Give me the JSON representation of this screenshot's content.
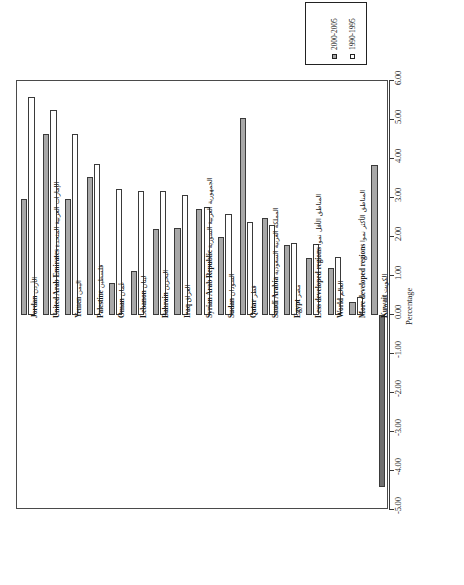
{
  "chart_data": {
    "type": "bar",
    "title": "",
    "xlabel": "",
    "ylabel": "Percentage",
    "ylim": [
      -5.0,
      6.0
    ],
    "tick_step": 1.0,
    "orientation": "rotated-vertical-bars",
    "grid": false,
    "legend_position": "top-right",
    "tick_labels": [
      "-5.00",
      "-4.00",
      "-3.00",
      "-2.00",
      "-1.00",
      "0.00",
      "1.00",
      "2.00",
      "3.00",
      "4.00",
      "5.00",
      "6.00"
    ],
    "tick_values": [
      -5,
      -4,
      -3,
      -2,
      -1,
      0,
      1,
      2,
      3,
      4,
      5,
      6
    ],
    "categories": [
      "الأردن Jordan",
      "الإمارات العربية المتحدة United Arab Emirates",
      "اليمن Yemen",
      "فلسطين Palestine",
      "عُمان Oman",
      "لبنان Lebanon",
      "البحرين Bahrain",
      "العراق Iraq",
      "الجمهورية العربية السورية Syrian Arab Republic",
      "السودان Sudan",
      "قطر Qatar",
      "المملكة العربية السعودية Saudi Arabia",
      "مصر Egypt",
      "الأقل نموا المناطق Less developed regions",
      "العالم World",
      "الأكثر نموا المناطق More developed regions",
      "الكويت Kuwait"
    ],
    "categories_ar": [
      "الأردن",
      "الإمارات العربية المتحدة",
      "اليمن",
      "فلسطين",
      "عُمان",
      "لبنان",
      "البحرين",
      "العراق",
      "الجمهورية العربية السورية",
      "السودان",
      "قطر",
      "المملكة العربية السعودية",
      "مصر",
      "المناطق الأقل نموا",
      "العالم",
      "المناطق الأكثر نموا",
      "الكويت"
    ],
    "categories_en": [
      "Jordan",
      "United Arab Emirates",
      "Yemen",
      "Palestine",
      "Oman",
      "Lebanon",
      "Bahrain",
      "Iraq",
      "Syrian Arab Republic",
      "Sudan",
      "Qatar",
      "Saudi Arabia",
      "Egypt",
      "Less developed regions",
      "World",
      "More developed regions",
      "Kuwait"
    ],
    "series": [
      {
        "name": "2000-2005",
        "color": "#a8a8a8",
        "values": [
          2.97,
          4.65,
          2.97,
          3.55,
          0.82,
          1.13,
          2.2,
          2.23,
          2.72,
          2.0,
          5.05,
          2.5,
          1.8,
          1.47,
          1.2,
          0.33,
          3.85
        ]
      },
      {
        "name": "1990-1995",
        "color": "#ffffff",
        "values": [
          5.6,
          5.25,
          4.63,
          3.87,
          3.23,
          3.18,
          3.17,
          3.08,
          2.77,
          2.6,
          2.38,
          2.3,
          1.85,
          1.82,
          1.5,
          0.46,
          -4.4
        ]
      }
    ]
  },
  "legend": {
    "entries": [
      {
        "label": "2000-2005",
        "swatch": "filled-gray-square"
      },
      {
        "label": "1990-1995",
        "swatch": "empty-white-square"
      }
    ]
  },
  "axis": {
    "title": "Percentage"
  }
}
